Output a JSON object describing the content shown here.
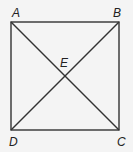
{
  "diagram": {
    "type": "square-with-diagonals",
    "points": {
      "A": {
        "label": "A",
        "x": 11,
        "y": 22
      },
      "B": {
        "label": "B",
        "x": 119,
        "y": 22
      },
      "C": {
        "label": "C",
        "x": 119,
        "y": 130
      },
      "D": {
        "label": "D",
        "x": 11,
        "y": 130
      },
      "E": {
        "label": "E",
        "x": 65,
        "y": 76
      }
    },
    "segments": [
      "AB",
      "BC",
      "CD",
      "DA",
      "AC",
      "BD"
    ],
    "stroke_color": "#333333",
    "background": "#f4f4f4"
  }
}
